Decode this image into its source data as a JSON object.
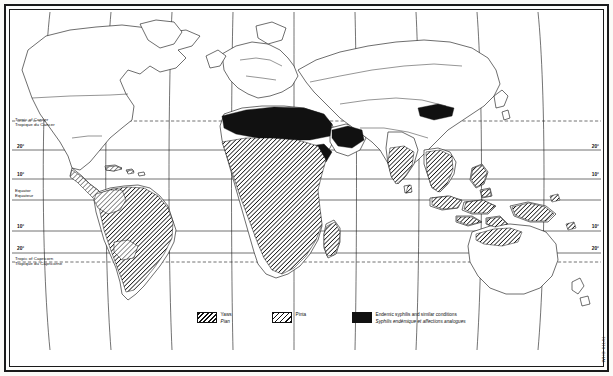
{
  "document": {
    "kind": "map",
    "title": "World distribution of endemic treponematoses",
    "projection_note": "cylindrical world map with curved meridians"
  },
  "reference_lines": {
    "tropic_cancer": {
      "en": "Tropic of Cancer",
      "fr": "Tropique du Cancer"
    },
    "equator": {
      "en": "Equator",
      "fr": "Equateur"
    },
    "tropic_capricorn": {
      "en": "Tropic of Capricorn",
      "fr": "Tropique du Capricorne"
    }
  },
  "latitude_labels": {
    "left": [
      "20°",
      "10°",
      "10°",
      "20°"
    ],
    "right": [
      "20°",
      "10°",
      "10°",
      "20°"
    ]
  },
  "legend": {
    "items": [
      {
        "key": "yaws",
        "pattern": "dense-diagonal-hatch",
        "line_en": "Yaws",
        "line_fr": "Pian",
        "color": "#111111"
      },
      {
        "key": "pinta",
        "pattern": "open-diagonal-hatch",
        "line_en": "Pinta",
        "line_fr": "",
        "color": "#111111"
      },
      {
        "key": "endemic_syphilis",
        "pattern": "solid-black",
        "line_en": "Endemic syphilis and similar conditions",
        "line_fr": "Syphilis endémique et affections analogues",
        "color": "#111111"
      }
    ]
  },
  "credit": "WHO 61141",
  "map_regions": {
    "yaws": [
      "Amazon basin and northern South America",
      "Central Africa and West Africa",
      "Southern Africa (eastern belt)",
      "Madagascar",
      "India (southern and eastern)",
      "Indochina and Thailand",
      "Indonesia",
      "Philippines",
      "New Guinea",
      "Northern Australia",
      "Pacific islands"
    ],
    "pinta": [
      "Mexico and Central America",
      "Northern Andes / Colombia",
      "Caribbean islands"
    ],
    "endemic_syphilis": [
      "Sahel belt of North Africa",
      "Arabian peninsula",
      "Mongolia and Central Asia",
      "Horn of Africa"
    ]
  }
}
